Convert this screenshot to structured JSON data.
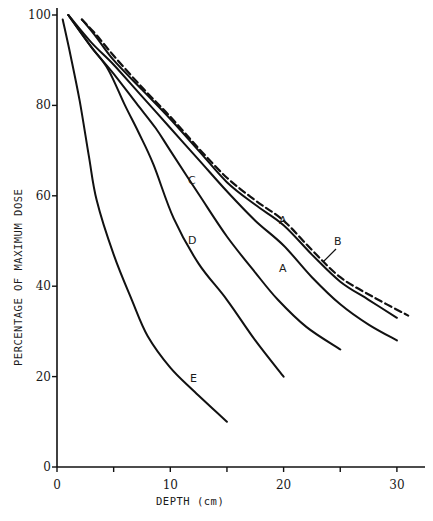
{
  "chart_data": {
    "type": "line",
    "title": "",
    "xlabel": "DEPTH (cm)",
    "ylabel": "PERCENTAGE OF MAXIMUM DOSE",
    "xlim": [
      0,
      33
    ],
    "ylim": [
      0,
      100
    ],
    "x_ticks": [
      0,
      5,
      10,
      15,
      20,
      25,
      30
    ],
    "x_tick_labels": [
      "0",
      "",
      "10",
      "",
      "20",
      "",
      "30"
    ],
    "y_ticks": [
      0,
      20,
      40,
      60,
      80,
      100
    ],
    "y_tick_labels": [
      "0",
      "20",
      "40",
      "60",
      "80",
      "100"
    ],
    "grid": false,
    "legend": "none (curves labeled inline)",
    "series": [
      {
        "name": "A (upper)",
        "style": "solid",
        "label_pos": [
          20,
          55
        ],
        "points": [
          [
            2.2,
            99
          ],
          [
            3.5,
            95
          ],
          [
            5,
            90
          ],
          [
            7.5,
            83.5
          ],
          [
            10,
            77
          ],
          [
            12.5,
            70
          ],
          [
            15,
            63
          ],
          [
            17.5,
            58
          ],
          [
            20,
            53.5
          ],
          [
            22.5,
            47
          ],
          [
            25,
            41
          ],
          [
            27.5,
            37
          ],
          [
            30,
            33
          ]
        ]
      },
      {
        "name": "B",
        "style": "dashed",
        "label_pos": [
          24.8,
          50
        ],
        "points": [
          [
            2.2,
            99
          ],
          [
            3.5,
            95.5
          ],
          [
            5,
            91
          ],
          [
            7.5,
            84
          ],
          [
            10,
            77.5
          ],
          [
            12.5,
            70.5
          ],
          [
            15,
            64
          ],
          [
            17.5,
            59
          ],
          [
            20,
            54.5
          ],
          [
            22.5,
            48
          ],
          [
            25,
            42
          ],
          [
            28,
            37.5
          ],
          [
            31,
            33.5
          ]
        ]
      },
      {
        "name": "A (lower)",
        "style": "solid",
        "label_pos": [
          20,
          44
        ],
        "points": [
          [
            1,
            100
          ],
          [
            3,
            94
          ],
          [
            5,
            89
          ],
          [
            7.5,
            82
          ],
          [
            10,
            75
          ],
          [
            12.5,
            68
          ],
          [
            15,
            61
          ],
          [
            17.5,
            54.5
          ],
          [
            20,
            49
          ],
          [
            22.5,
            42
          ],
          [
            25,
            36
          ],
          [
            27.5,
            31.5
          ],
          [
            30,
            28
          ]
        ]
      },
      {
        "name": "C",
        "style": "solid",
        "label_pos": [
          12,
          63
        ],
        "points": [
          [
            1,
            100
          ],
          [
            3,
            93
          ],
          [
            5,
            87
          ],
          [
            7,
            80.5
          ],
          [
            8.7,
            75
          ],
          [
            10,
            70
          ],
          [
            12.6,
            60
          ],
          [
            15,
            51
          ],
          [
            17.5,
            43
          ],
          [
            19.5,
            37
          ],
          [
            22,
            31
          ],
          [
            25,
            26
          ]
        ]
      },
      {
        "name": "D",
        "style": "solid",
        "label_pos": [
          12,
          50
        ],
        "points": [
          [
            1,
            100
          ],
          [
            3,
            93
          ],
          [
            4.5,
            88
          ],
          [
            6,
            80
          ],
          [
            7.2,
            74
          ],
          [
            8.5,
            67
          ],
          [
            10.3,
            55
          ],
          [
            12.5,
            45
          ],
          [
            15,
            37
          ],
          [
            17.5,
            28
          ],
          [
            20,
            20
          ]
        ]
      },
      {
        "name": "E",
        "style": "solid",
        "label_pos": [
          12,
          19
        ],
        "points": [
          [
            0.5,
            99
          ],
          [
            1.2,
            91
          ],
          [
            2,
            81
          ],
          [
            2.8,
            69
          ],
          [
            3.5,
            59
          ],
          [
            5,
            47
          ],
          [
            6.6,
            37
          ],
          [
            8,
            29
          ],
          [
            10,
            22
          ],
          [
            12,
            17
          ],
          [
            15,
            10
          ]
        ]
      }
    ]
  },
  "layout": {
    "origin_px": [
      57,
      467
    ],
    "px_per_x": 11.33,
    "px_per_y": 4.52,
    "x_axis_end_px": 425,
    "y_axis_top_px": 8,
    "line_color": "#111111"
  }
}
